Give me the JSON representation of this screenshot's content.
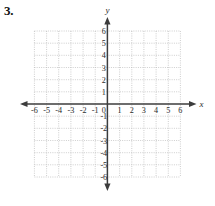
{
  "problem": {
    "number_label": "3."
  },
  "chart_data": {
    "type": "scatter",
    "title": "",
    "subtitle": "",
    "xlabel": "x",
    "ylabel": "y",
    "xlim": [
      -6,
      6
    ],
    "ylim": [
      -6,
      6
    ],
    "grid": true,
    "grid_style": "dotted",
    "grid_step": 1,
    "legend": "none",
    "series": [
      {
        "name": "plotted-points",
        "x": [],
        "y": []
      }
    ],
    "annotations": [],
    "x_ticks": [
      -6,
      -5,
      -4,
      -3,
      -2,
      -1,
      1,
      2,
      3,
      4,
      5,
      6
    ],
    "y_ticks": [
      -6,
      -5,
      -4,
      -3,
      -2,
      -1,
      1,
      2,
      3,
      4,
      5,
      6
    ],
    "x_tick_labels": [
      "-6",
      "-5",
      "-4",
      "-3",
      "-2",
      "-1",
      "1",
      "2",
      "3",
      "4",
      "5",
      "6"
    ],
    "y_tick_labels": [
      "-6",
      "-5",
      "-4",
      "-3",
      "-2",
      "-1",
      "1",
      "2",
      "3",
      "4",
      "5",
      "6"
    ],
    "origin_label": "0",
    "axis_arrows": [
      "left",
      "right",
      "up",
      "down"
    ],
    "colors": {
      "axis": "#3c3c3c",
      "grid": "#b9b9b9",
      "text": "#2b2b2b",
      "background": "#ffffff"
    }
  }
}
